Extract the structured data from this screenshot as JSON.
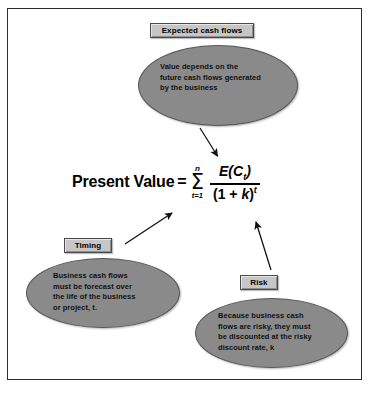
{
  "diagram": {
    "colors": {
      "ellipse_fill": "#8a8a8a",
      "box_fill": "#c6c6c6",
      "border": "#2c2c2c",
      "background": "#ffffff"
    },
    "boxes": [
      {
        "id": "expected-cash-flows",
        "label": "Expected cash flows"
      },
      {
        "id": "timing",
        "label": "Timing"
      },
      {
        "id": "risk",
        "label": "Risk"
      }
    ],
    "ellipses": [
      {
        "id": "expected-cash-flows-note",
        "lines": [
          "Value depends on the",
          "future cash flows generated",
          "by the business"
        ]
      },
      {
        "id": "timing-note",
        "lines": [
          "Business cash flows",
          "must be forecast over",
          "the life of the business",
          "or project, t."
        ]
      },
      {
        "id": "risk-note",
        "lines": [
          "Because business cash",
          "flows are risky, they must",
          "be discounted at the risky",
          "discount rate, k"
        ]
      }
    ],
    "formula": {
      "label": "Present Value",
      "equals": "=",
      "sigma_symbol": "Σ",
      "sigma_upper": "n",
      "sigma_lower": "t=1",
      "numerator": "E(C",
      "numerator_sub": "t",
      "numerator_close": ")",
      "denominator_open": "(1 + ",
      "denominator_var": "k",
      "denominator_close": ")",
      "denominator_exp": "t"
    },
    "arrows": [
      {
        "id": "arrow-expected-to-formula",
        "from": "expected-cash-flows-note",
        "to": "formula-numerator"
      },
      {
        "id": "arrow-timing-to-formula",
        "from": "timing",
        "to": "formula-denominator-exponent"
      },
      {
        "id": "arrow-risk-to-formula",
        "from": "risk",
        "to": "formula-denominator"
      }
    ]
  }
}
